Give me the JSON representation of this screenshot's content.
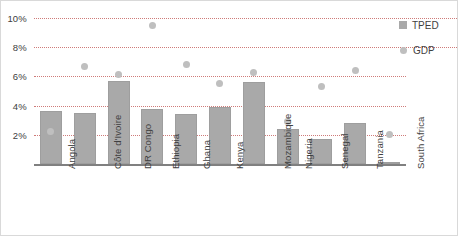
{
  "chart_data": {
    "type": "bar",
    "title": "",
    "subtitle": "",
    "xlabel": "",
    "ylabel": "",
    "ylim": [
      0,
      10
    ],
    "yticks": [
      2,
      4,
      6,
      8,
      10
    ],
    "ytick_labels": [
      "2%",
      "4%",
      "6%",
      "8%",
      "10%"
    ],
    "grid": true,
    "grid_style": "dotted",
    "grid_color": "#c0504d",
    "legend_position": "right",
    "categories": [
      "Angola",
      "Côte d'Ivoire",
      "DR Congo",
      "Ethiopia",
      "Ghana",
      "Kenya",
      "Mozambique",
      "Nigeria",
      "Senegal",
      "Tanzania",
      "South Africa"
    ],
    "series": [
      {
        "name": "TPED",
        "type": "bar",
        "color": "#a9a9a9",
        "values": [
          3.6,
          3.5,
          5.7,
          3.8,
          3.4,
          3.9,
          5.6,
          2.4,
          1.7,
          2.8,
          0.15
        ]
      },
      {
        "name": "GDP",
        "type": "scatter",
        "color": "#bfbfbf",
        "values": [
          2.2,
          6.7,
          6.1,
          9.5,
          6.8,
          5.5,
          6.3,
          2.9,
          5.3,
          6.4,
          2.0
        ]
      }
    ]
  },
  "legend": {
    "items": [
      {
        "label": "TPED",
        "marker": "square-marker"
      },
      {
        "label": "GDP",
        "marker": "circle-marker"
      }
    ]
  }
}
